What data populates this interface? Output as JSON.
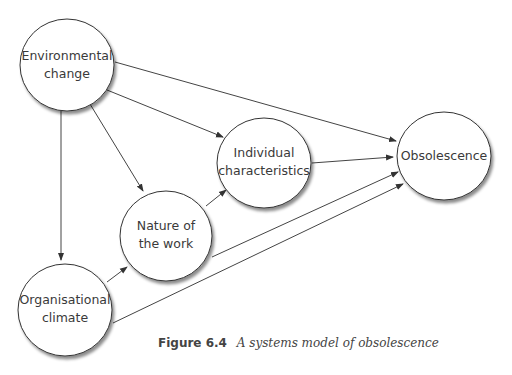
{
  "diagram": {
    "nodes": [
      {
        "id": "environmental",
        "lines": [
          "Environmental",
          "change"
        ]
      },
      {
        "id": "individual",
        "lines": [
          "Individual",
          "characteristics"
        ]
      },
      {
        "id": "obsolescence",
        "lines": [
          "Obsolescence"
        ]
      },
      {
        "id": "nature",
        "lines": [
          "Nature of",
          "the work"
        ]
      },
      {
        "id": "organisational",
        "lines": [
          "Organisational",
          "climate"
        ]
      }
    ],
    "edges": [
      {
        "from": "environmental",
        "to": "obsolescence"
      },
      {
        "from": "environmental",
        "to": "individual"
      },
      {
        "from": "environmental",
        "to": "nature"
      },
      {
        "from": "environmental",
        "to": "organisational"
      },
      {
        "from": "organisational",
        "to": "nature"
      },
      {
        "from": "organisational",
        "to": "obsolescence"
      },
      {
        "from": "nature",
        "to": "individual"
      },
      {
        "from": "nature",
        "to": "obsolescence"
      },
      {
        "from": "individual",
        "to": "obsolescence"
      }
    ]
  },
  "caption": {
    "figure_label": "Figure 6.4",
    "title": "A systems model of obsolescence"
  }
}
